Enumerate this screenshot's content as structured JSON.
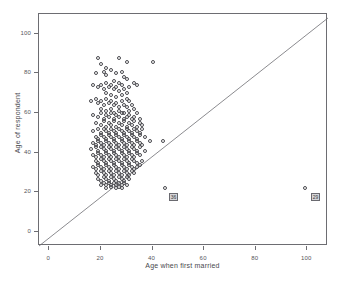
{
  "title_remnant": "",
  "axes": {
    "x": {
      "label": "Age when first married",
      "ticks": [
        0,
        20,
        40,
        60,
        80,
        100
      ],
      "min": -4,
      "max": 108
    },
    "y": {
      "label": "Age of respondent",
      "ticks": [
        0,
        20,
        40,
        60,
        80,
        100
      ],
      "min": -7,
      "max": 110
    }
  },
  "reference_line": {
    "name": "y-equals-x-diagonal",
    "from": [
      -4,
      -7
    ],
    "to": [
      108,
      108
    ]
  },
  "case_labels": [
    {
      "text": "36",
      "x": 46,
      "y": 20
    },
    {
      "text": "29",
      "x": 101,
      "y": 20
    }
  ],
  "chart_data": {
    "type": "scatter",
    "title": "",
    "xlabel": "Age when first married",
    "ylabel": "Age of respondent",
    "xlim": [
      -4,
      108
    ],
    "ylim": [
      -7,
      110
    ],
    "xticks": [
      0,
      20,
      40,
      60,
      80,
      100
    ],
    "yticks": [
      0,
      20,
      40,
      60,
      80,
      100
    ],
    "grid": false,
    "legend": null,
    "marker": "open-circle",
    "marker_color": "#4a4a4f",
    "annotations": [
      {
        "type": "case-label",
        "text": "36",
        "x": 46,
        "y": 20
      },
      {
        "type": "case-label",
        "text": "29",
        "x": 101,
        "y": 20
      }
    ],
    "series": [
      {
        "name": "respondents",
        "points": [
          [
            19,
            88
          ],
          [
            20,
            85
          ],
          [
            27,
            88
          ],
          [
            30,
            86
          ],
          [
            18,
            80
          ],
          [
            21,
            81
          ],
          [
            22,
            83
          ],
          [
            22,
            79
          ],
          [
            24,
            82
          ],
          [
            26,
            80
          ],
          [
            28,
            81
          ],
          [
            29,
            78
          ],
          [
            30,
            77
          ],
          [
            40,
            86
          ],
          [
            25,
            76
          ],
          [
            27,
            75
          ],
          [
            33,
            75
          ],
          [
            17,
            74
          ],
          [
            19,
            73
          ],
          [
            20,
            74
          ],
          [
            21,
            72
          ],
          [
            22,
            75
          ],
          [
            23,
            73
          ],
          [
            24,
            74
          ],
          [
            25,
            72
          ],
          [
            26,
            73
          ],
          [
            27,
            71
          ],
          [
            28,
            74
          ],
          [
            29,
            72
          ],
          [
            30,
            70
          ],
          [
            31,
            73
          ],
          [
            34,
            74
          ],
          [
            22,
            70
          ],
          [
            24,
            69
          ],
          [
            26,
            68
          ],
          [
            28,
            69
          ],
          [
            30,
            67
          ],
          [
            16,
            66
          ],
          [
            18,
            67
          ],
          [
            19,
            65
          ],
          [
            20,
            66
          ],
          [
            21,
            64
          ],
          [
            22,
            67
          ],
          [
            23,
            65
          ],
          [
            24,
            66
          ],
          [
            25,
            64
          ],
          [
            26,
            65
          ],
          [
            27,
            63
          ],
          [
            28,
            66
          ],
          [
            29,
            64
          ],
          [
            30,
            63
          ],
          [
            31,
            66
          ],
          [
            32,
            64
          ],
          [
            33,
            62
          ],
          [
            20,
            62
          ],
          [
            22,
            61
          ],
          [
            24,
            62
          ],
          [
            25,
            60
          ],
          [
            27,
            61
          ],
          [
            29,
            60
          ],
          [
            31,
            61
          ],
          [
            17,
            59
          ],
          [
            19,
            58
          ],
          [
            20,
            60
          ],
          [
            21,
            57
          ],
          [
            22,
            59
          ],
          [
            23,
            58
          ],
          [
            24,
            60
          ],
          [
            25,
            57
          ],
          [
            26,
            59
          ],
          [
            27,
            58
          ],
          [
            28,
            60
          ],
          [
            29,
            57
          ],
          [
            30,
            58
          ],
          [
            31,
            59
          ],
          [
            32,
            57
          ],
          [
            33,
            58
          ],
          [
            34,
            60
          ],
          [
            35,
            57
          ],
          [
            18,
            55
          ],
          [
            20,
            54
          ],
          [
            21,
            56
          ],
          [
            22,
            53
          ],
          [
            23,
            55
          ],
          [
            24,
            54
          ],
          [
            25,
            56
          ],
          [
            26,
            53
          ],
          [
            27,
            55
          ],
          [
            28,
            54
          ],
          [
            29,
            56
          ],
          [
            30,
            53
          ],
          [
            31,
            55
          ],
          [
            32,
            54
          ],
          [
            33,
            56
          ],
          [
            34,
            53
          ],
          [
            35,
            55
          ],
          [
            36,
            54
          ],
          [
            17,
            51
          ],
          [
            19,
            52
          ],
          [
            20,
            50
          ],
          [
            21,
            52
          ],
          [
            22,
            51
          ],
          [
            23,
            50
          ],
          [
            24,
            52
          ],
          [
            25,
            51
          ],
          [
            26,
            50
          ],
          [
            27,
            52
          ],
          [
            28,
            51
          ],
          [
            29,
            50
          ],
          [
            30,
            52
          ],
          [
            31,
            51
          ],
          [
            32,
            50
          ],
          [
            33,
            52
          ],
          [
            34,
            51
          ],
          [
            35,
            50
          ],
          [
            36,
            52
          ],
          [
            18,
            48
          ],
          [
            19,
            47
          ],
          [
            20,
            49
          ],
          [
            21,
            48
          ],
          [
            22,
            47
          ],
          [
            23,
            49
          ],
          [
            24,
            48
          ],
          [
            25,
            47
          ],
          [
            26,
            49
          ],
          [
            27,
            48
          ],
          [
            28,
            47
          ],
          [
            29,
            49
          ],
          [
            30,
            48
          ],
          [
            31,
            47
          ],
          [
            32,
            49
          ],
          [
            33,
            48
          ],
          [
            34,
            47
          ],
          [
            35,
            49
          ],
          [
            37,
            48
          ],
          [
            39,
            46
          ],
          [
            44,
            46
          ],
          [
            17,
            45
          ],
          [
            18,
            44
          ],
          [
            19,
            46
          ],
          [
            20,
            45
          ],
          [
            21,
            44
          ],
          [
            22,
            46
          ],
          [
            23,
            45
          ],
          [
            24,
            44
          ],
          [
            25,
            46
          ],
          [
            26,
            45
          ],
          [
            27,
            44
          ],
          [
            28,
            46
          ],
          [
            29,
            45
          ],
          [
            30,
            44
          ],
          [
            31,
            46
          ],
          [
            32,
            45
          ],
          [
            33,
            44
          ],
          [
            34,
            46
          ],
          [
            35,
            45
          ],
          [
            36,
            44
          ],
          [
            16,
            42
          ],
          [
            18,
            43
          ],
          [
            19,
            41
          ],
          [
            20,
            43
          ],
          [
            21,
            42
          ],
          [
            22,
            41
          ],
          [
            23,
            43
          ],
          [
            24,
            42
          ],
          [
            25,
            41
          ],
          [
            26,
            43
          ],
          [
            27,
            42
          ],
          [
            28,
            41
          ],
          [
            29,
            43
          ],
          [
            30,
            42
          ],
          [
            31,
            41
          ],
          [
            32,
            43
          ],
          [
            33,
            42
          ],
          [
            34,
            41
          ],
          [
            35,
            43
          ],
          [
            37,
            41
          ],
          [
            17,
            39
          ],
          [
            18,
            38
          ],
          [
            19,
            40
          ],
          [
            20,
            39
          ],
          [
            21,
            38
          ],
          [
            22,
            40
          ],
          [
            23,
            39
          ],
          [
            24,
            38
          ],
          [
            25,
            40
          ],
          [
            26,
            39
          ],
          [
            27,
            38
          ],
          [
            28,
            40
          ],
          [
            29,
            39
          ],
          [
            30,
            38
          ],
          [
            31,
            40
          ],
          [
            32,
            39
          ],
          [
            33,
            38
          ],
          [
            34,
            40
          ],
          [
            35,
            39
          ],
          [
            18,
            36
          ],
          [
            19,
            35
          ],
          [
            20,
            37
          ],
          [
            21,
            36
          ],
          [
            22,
            35
          ],
          [
            23,
            37
          ],
          [
            24,
            36
          ],
          [
            25,
            35
          ],
          [
            26,
            37
          ],
          [
            27,
            36
          ],
          [
            28,
            35
          ],
          [
            29,
            37
          ],
          [
            30,
            36
          ],
          [
            31,
            35
          ],
          [
            32,
            37
          ],
          [
            33,
            36
          ],
          [
            34,
            35
          ],
          [
            35,
            34
          ],
          [
            36,
            36
          ],
          [
            17,
            33
          ],
          [
            18,
            32
          ],
          [
            19,
            34
          ],
          [
            20,
            33
          ],
          [
            21,
            32
          ],
          [
            22,
            34
          ],
          [
            23,
            33
          ],
          [
            24,
            32
          ],
          [
            25,
            34
          ],
          [
            26,
            33
          ],
          [
            27,
            32
          ],
          [
            28,
            34
          ],
          [
            29,
            33
          ],
          [
            30,
            32
          ],
          [
            31,
            34
          ],
          [
            32,
            33
          ],
          [
            33,
            32
          ],
          [
            34,
            33
          ],
          [
            18,
            30
          ],
          [
            19,
            29
          ],
          [
            20,
            31
          ],
          [
            21,
            30
          ],
          [
            22,
            29
          ],
          [
            23,
            31
          ],
          [
            24,
            30
          ],
          [
            25,
            29
          ],
          [
            26,
            31
          ],
          [
            27,
            30
          ],
          [
            28,
            29
          ],
          [
            29,
            31
          ],
          [
            30,
            30
          ],
          [
            31,
            29
          ],
          [
            32,
            31
          ],
          [
            33,
            30
          ],
          [
            19,
            27
          ],
          [
            20,
            26
          ],
          [
            21,
            28
          ],
          [
            22,
            27
          ],
          [
            23,
            26
          ],
          [
            24,
            28
          ],
          [
            25,
            27
          ],
          [
            26,
            26
          ],
          [
            27,
            28
          ],
          [
            28,
            27
          ],
          [
            29,
            26
          ],
          [
            30,
            28
          ],
          [
            31,
            27
          ],
          [
            20,
            24
          ],
          [
            21,
            25
          ],
          [
            22,
            24
          ],
          [
            23,
            25
          ],
          [
            24,
            24
          ],
          [
            25,
            25
          ],
          [
            26,
            24
          ],
          [
            27,
            25
          ],
          [
            28,
            24
          ],
          [
            29,
            25
          ],
          [
            30,
            24
          ],
          [
            22,
            22
          ],
          [
            24,
            23
          ],
          [
            26,
            22
          ],
          [
            27,
            23
          ],
          [
            28,
            22
          ],
          [
            45,
            22
          ],
          [
            99,
            22
          ]
        ]
      }
    ]
  }
}
